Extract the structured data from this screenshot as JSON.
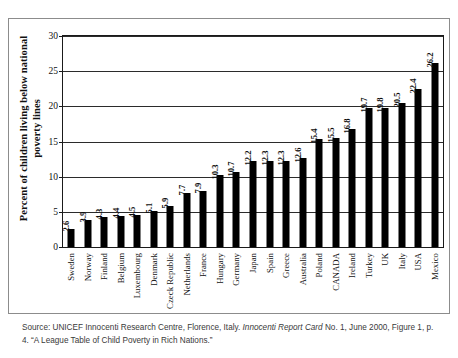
{
  "chart_data": {
    "type": "bar",
    "title": "",
    "subtitle": "",
    "xlabel": "",
    "ylabel": "Percent of children living below national poverty lines",
    "ylim": [
      0,
      30
    ],
    "ytick_step": 5,
    "yticks": [
      "30",
      "25",
      "20",
      "15",
      "10",
      "5",
      "0"
    ],
    "grid": true,
    "legend": "none",
    "bar_color": "#000000",
    "categories": [
      "Sweden",
      "Norway",
      "Finland",
      "Belgium",
      "Luxembourg",
      "Denmark",
      "Czeck Republic",
      "Netherlands",
      "France",
      "Hungary",
      "Germany",
      "Japan",
      "Spain",
      "Greece",
      "Australia",
      "Poland",
      "CANADA",
      "Ireland",
      "Turkey",
      "UK",
      "Italy",
      "USA",
      "Mexico"
    ],
    "values": [
      2.6,
      3.9,
      4.3,
      4.4,
      4.5,
      5.1,
      5.9,
      7.7,
      7.9,
      10.3,
      10.7,
      12.2,
      12.3,
      12.3,
      12.6,
      15.4,
      15.5,
      16.8,
      19.7,
      19.8,
      20.5,
      22.4,
      26.2
    ],
    "value_labels": [
      "2.6",
      "3.9",
      "4.3",
      "4.4",
      "4.5",
      "5.1",
      "5.9",
      "7.7",
      "7.9",
      "10.3",
      "10.7",
      "12.2",
      "12.3",
      "12.3",
      "12.6",
      "15.4",
      "15.5",
      "16.8",
      "19.7",
      "19.8",
      "20.5",
      "22.4",
      "26.2"
    ]
  },
  "caption": {
    "line1_pre": "Source: UNICEF Innocenti Research Centre, Florence, Italy. ",
    "line1_italic": "Innocenti Report Card",
    "line1_post": " No. 1, June 2000, Figure 1,",
    "line2": "p. 4. “A League Table of Child Poverty in Rich Nations.”"
  }
}
